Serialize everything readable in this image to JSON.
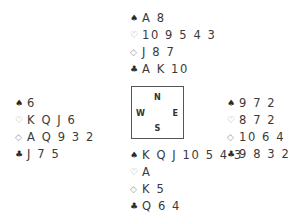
{
  "suits": {
    "spades": "♠",
    "hearts": "♡",
    "diamonds": "◇",
    "clubs": "♣"
  },
  "compass": {
    "north": "N",
    "south": "S",
    "east": "E",
    "west": "W"
  },
  "hands": {
    "north": {
      "spades": "A 8",
      "hearts": "10 9 5 4 3",
      "diamonds": "J 8 7",
      "clubs": "A K 10"
    },
    "west": {
      "spades": "6",
      "hearts": "K Q J 6",
      "diamonds": "A Q 9 3 2",
      "clubs": "J 7 5"
    },
    "east": {
      "spades": "9 7 2",
      "hearts": "8 7 2",
      "diamonds": "10 6 4",
      "clubs": "9 8 3 2"
    },
    "south": {
      "spades": "K Q J 10 5 4 3",
      "hearts": "A",
      "diamonds": "K 5",
      "clubs": "Q 6 4"
    }
  }
}
